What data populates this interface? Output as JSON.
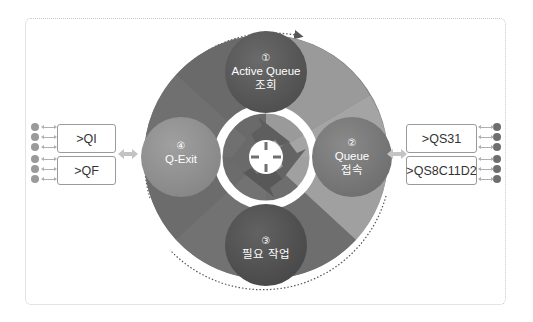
{
  "diagram": {
    "steps": [
      {
        "id": 1,
        "number": "①",
        "title": "Active Queue",
        "subtitle": "조회",
        "color": "#5a5a5a"
      },
      {
        "id": 2,
        "number": "②",
        "title": "Queue",
        "subtitle": "접속",
        "color": "#7a7a7a"
      },
      {
        "id": 3,
        "number": "③",
        "title": "",
        "subtitle": "필요 작업",
        "color": "#555555"
      },
      {
        "id": 4,
        "number": "④",
        "title": "Q-Exit",
        "subtitle": "",
        "color": "#8c8c8c"
      }
    ],
    "left_queues": [
      {
        "label": ">QI"
      },
      {
        "label": ">QF"
      }
    ],
    "right_queues": [
      {
        "label": ">QS31"
      },
      {
        "label": ">QS8C11D2"
      }
    ],
    "left_dot_count": 6,
    "right_dot_count": 6,
    "colors": {
      "ring_dark": "#6b6b6b",
      "ring_light": "#9c9c9c",
      "ring_mid": "#828282",
      "connector": "#c4c4c4",
      "box_border": "#9a9a9a"
    },
    "center_icon": "cycle-arrows-icon"
  }
}
